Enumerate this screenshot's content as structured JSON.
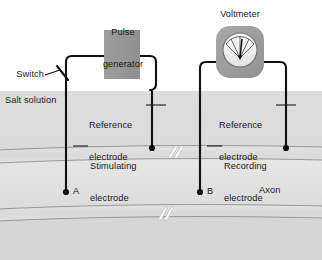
{
  "figure": {
    "width": 322,
    "height": 260
  },
  "colors": {
    "background": "#ffffff",
    "salt_solution": "#d9d9d9",
    "axon_band": "#dedede",
    "axon_core": "#e4e4e4",
    "device_fill": "#9a9a9a",
    "voltmeter_body": "#9e9e9e",
    "dial_face": "#f2f2f2",
    "wire": "#111111",
    "text": "#1a1a1a",
    "membrane_line": "#8d8d8d",
    "border": "#9c9c9c"
  },
  "devices": {
    "pulse_generator": {
      "label_line1": "Pulse",
      "label_line2": "generator",
      "icon": "rectangle-box"
    },
    "voltmeter": {
      "label": "Voltmeter",
      "icon": "gauge-dial-icon"
    }
  },
  "labels": {
    "switch": "Switch",
    "salt_solution": "Salt solution",
    "reference_electrode_left_line1": "Reference",
    "reference_electrode_left_line2": "electrode",
    "reference_electrode_right_line1": "Reference",
    "reference_electrode_right_line2": "electrode",
    "stimulating_electrode_line1": "Stimulating",
    "stimulating_electrode_line2": "electrode",
    "recording_electrode_line1": "Recording",
    "recording_electrode_line2": "electrode",
    "axon": "Axon",
    "point_a": "A",
    "point_b": "B"
  },
  "electrodes": [
    {
      "name": "stimulating-electrode",
      "tip_label": "A",
      "tip_x": 66,
      "tip_y": 192
    },
    {
      "name": "reference-electrode-left",
      "tip_label": "",
      "tip_x": 152,
      "tip_y": 148
    },
    {
      "name": "recording-electrode",
      "tip_label": "B",
      "tip_x": 200,
      "tip_y": 192
    },
    {
      "name": "reference-electrode-right",
      "tip_label": "",
      "tip_x": 286,
      "tip_y": 148
    }
  ]
}
